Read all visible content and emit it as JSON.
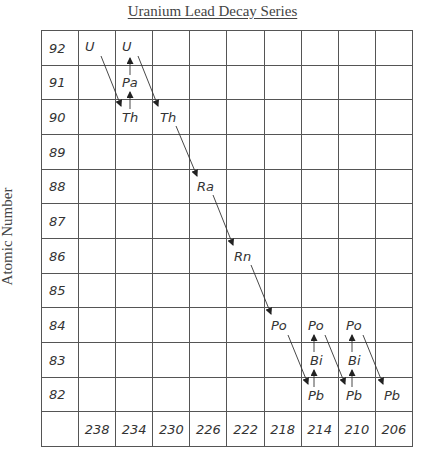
{
  "title": "Uranium Lead Decay Series",
  "y_axis_label": "Atomic Number",
  "atomic_numbers": [
    "92",
    "91",
    "90",
    "89",
    "88",
    "87",
    "86",
    "85",
    "84",
    "83",
    "82"
  ],
  "mass_numbers": [
    "238",
    "234",
    "230",
    "226",
    "222",
    "218",
    "214",
    "210",
    "206"
  ],
  "elements": [
    {
      "symbol": "U",
      "mass": "238",
      "z": "92"
    },
    {
      "symbol": "U",
      "mass": "234",
      "z": "92"
    },
    {
      "symbol": "Pa",
      "mass": "234",
      "z": "91"
    },
    {
      "symbol": "Th",
      "mass": "234",
      "z": "90"
    },
    {
      "symbol": "Th",
      "mass": "230",
      "z": "90"
    },
    {
      "symbol": "Ra",
      "mass": "226",
      "z": "88"
    },
    {
      "symbol": "Rn",
      "mass": "222",
      "z": "86"
    },
    {
      "symbol": "Po",
      "mass": "218",
      "z": "84"
    },
    {
      "symbol": "Po",
      "mass": "214",
      "z": "84"
    },
    {
      "symbol": "Bi",
      "mass": "214",
      "z": "83"
    },
    {
      "symbol": "Pb",
      "mass": "214",
      "z": "82"
    },
    {
      "symbol": "Po",
      "mass": "210",
      "z": "84"
    },
    {
      "symbol": "Bi",
      "mass": "210",
      "z": "83"
    },
    {
      "symbol": "Pb",
      "mass": "210",
      "z": "82"
    },
    {
      "symbol": "Pb",
      "mass": "206",
      "z": "82"
    }
  ],
  "decays": [
    {
      "from": "U-238",
      "to": "Th-234",
      "type": "alpha"
    },
    {
      "from": "Th-234",
      "to": "Pa-234",
      "type": "beta"
    },
    {
      "from": "Pa-234",
      "to": "U-234",
      "type": "beta"
    },
    {
      "from": "U-234",
      "to": "Th-230",
      "type": "alpha"
    },
    {
      "from": "Th-230",
      "to": "Ra-226",
      "type": "alpha"
    },
    {
      "from": "Ra-226",
      "to": "Rn-222",
      "type": "alpha"
    },
    {
      "from": "Rn-222",
      "to": "Po-218",
      "type": "alpha"
    },
    {
      "from": "Po-218",
      "to": "Pb-214",
      "type": "alpha"
    },
    {
      "from": "Pb-214",
      "to": "Bi-214",
      "type": "beta"
    },
    {
      "from": "Bi-214",
      "to": "Po-214",
      "type": "beta"
    },
    {
      "from": "Po-214",
      "to": "Pb-210",
      "type": "alpha"
    },
    {
      "from": "Pb-210",
      "to": "Bi-210",
      "type": "beta"
    },
    {
      "from": "Bi-210",
      "to": "Po-210",
      "type": "beta"
    },
    {
      "from": "Po-210",
      "to": "Pb-206",
      "type": "alpha"
    }
  ],
  "colors": {
    "grid": "#555555",
    "text": "#333333",
    "title": "#444444"
  }
}
